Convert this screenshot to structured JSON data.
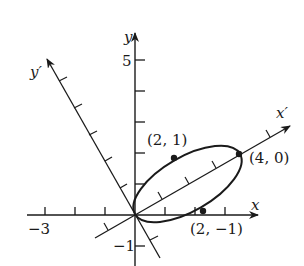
{
  "diagram": {
    "type": "rotated-axes-ellipse",
    "axes": {
      "x_label": "x",
      "y_label": "y",
      "x_prime_label": "x′",
      "y_prime_label": "y′"
    },
    "tick_labels": {
      "x_neg3": "−3",
      "y_5": "5",
      "y_neg1": "−1"
    },
    "points": [
      {
        "label": "(2, 1)",
        "x": 2,
        "y": 1
      },
      {
        "label": "(4, 0)",
        "x": 4,
        "y": 0
      },
      {
        "label": "(2, −1)",
        "x": 2,
        "y": -1
      }
    ],
    "colors": {
      "stroke": "#1a1a1a",
      "background": "#ffffff"
    }
  }
}
